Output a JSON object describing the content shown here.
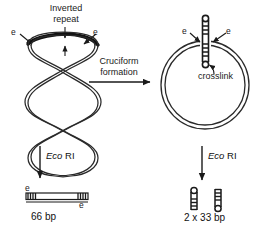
{
  "figure": {
    "title_visible": false,
    "background": "#ffffff",
    "ink": "#1a1a1a"
  },
  "left_panel": {
    "name": "supercoiled-dna-panel",
    "inverted_repeat_label": "Inverted\nrepeat",
    "inverted_repeat_line1": "Inverted",
    "inverted_repeat_line2": "repeat",
    "e_label_left": "e",
    "e_label_right": "e",
    "structure": "supercoiled-plectoneme"
  },
  "transition": {
    "name": "cruciform-formation-arrow",
    "line1": "Cruciform",
    "line2": "formation",
    "direction": "right"
  },
  "right_panel": {
    "name": "relaxed-circle-cruciform-panel",
    "e_label_left": "e",
    "e_label_right": "e",
    "crosslink_label": "crosslink",
    "structure": "relaxed-circle-with-cruciform"
  },
  "left_digest": {
    "name": "ecori-digest-left",
    "enzyme_italic": "Eco",
    "enzyme_roman": "RI",
    "product_label": "66 bp",
    "e_label_top": "e",
    "e_label_bottom": "e",
    "product": "linear-duplex"
  },
  "right_digest": {
    "name": "ecori-digest-right",
    "enzyme_italic": "Eco",
    "enzyme_roman": "RI",
    "product_label": "2 x 33 bp",
    "product": "two-hairpins"
  }
}
